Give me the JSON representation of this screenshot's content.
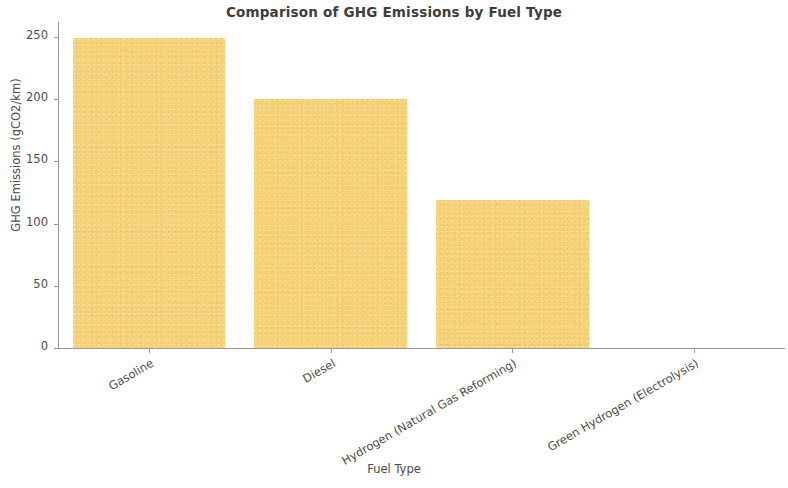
{
  "chart_data": {
    "type": "bar",
    "title": "Comparison of GHG Emissions by Fuel Type",
    "xlabel": "Fuel Type",
    "ylabel": "GHG Emissions (gCO2/km)",
    "categories": [
      "Gasoline",
      "Diesel",
      "Hydrogen (Natural Gas Reforming)",
      "Green Hydrogen (Electrolysis)"
    ],
    "values": [
      249,
      200,
      119,
      0
    ],
    "ylim": [
      0,
      262
    ],
    "yticks": [
      0,
      50,
      100,
      150,
      200,
      250
    ],
    "ytick_labels": [
      "0",
      "50",
      "100",
      "150",
      "200",
      "250"
    ],
    "grid": false,
    "legend": false,
    "bar_color": "#f6d074",
    "axis_color": "#9a9a9a",
    "text_color": "#4d4d4d",
    "title_color": "#3d3d3d",
    "background": "#ffffff",
    "xtick_label_rotation": -30
  }
}
